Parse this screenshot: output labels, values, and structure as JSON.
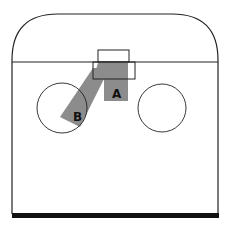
{
  "diagram": {
    "type": "hockey-rink-half-zone",
    "labels": {
      "zone_a": "A",
      "zone_b": "B"
    },
    "colors": {
      "line": "#222222",
      "shaded_zone": "#8c8c8c",
      "background": "#ffffff",
      "board_bottom": "#111111"
    }
  }
}
